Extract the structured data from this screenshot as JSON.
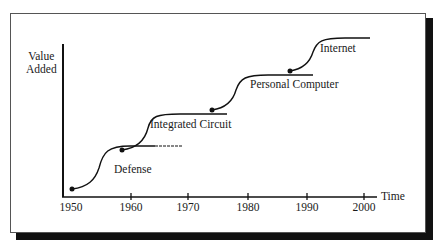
{
  "figure": {
    "y_axis_label_line1": "Value",
    "y_axis_label_line2": "Added",
    "x_axis_label": "Time",
    "x_ticks": [
      "1950",
      "1960",
      "1970",
      "1980",
      "1990",
      "2000"
    ],
    "waves": [
      {
        "label": "Defense"
      },
      {
        "label": "Integrated Circuit"
      },
      {
        "label": "Personal Computer"
      },
      {
        "label": "Internet"
      }
    ],
    "caption": ""
  }
}
